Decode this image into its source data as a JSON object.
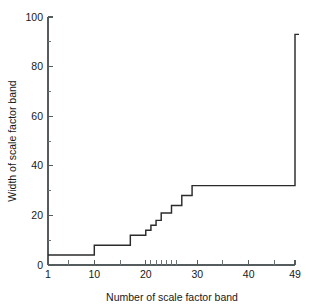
{
  "chart_data": {
    "type": "line",
    "line_style": "step-post",
    "title": "",
    "subtitle": "",
    "xlabel": "Number of scale factor band",
    "ylabel": "Width of scale factor band",
    "xlim": [
      1,
      49
    ],
    "ylim": [
      0,
      100
    ],
    "grid": false,
    "legend": null,
    "x_ticks_major": [
      1,
      10,
      20,
      30,
      40,
      49
    ],
    "x_tick_labels": [
      "1",
      "10",
      "20",
      "30",
      "40",
      "49"
    ],
    "x_ticks_minor": [
      5,
      15,
      21,
      22,
      23,
      24,
      25,
      26,
      35,
      45
    ],
    "y_ticks_major": [
      0,
      20,
      40,
      60,
      80,
      100
    ],
    "y_tick_labels": [
      "0",
      "20",
      "40",
      "60",
      "80",
      "100"
    ],
    "y_ticks_minor": [
      10,
      30,
      50,
      70,
      90
    ],
    "x": [
      1,
      2,
      3,
      4,
      5,
      6,
      7,
      8,
      9,
      10,
      11,
      12,
      13,
      14,
      15,
      16,
      17,
      18,
      19,
      20,
      21,
      22,
      23,
      24,
      25,
      26,
      27,
      28,
      29,
      30,
      31,
      32,
      33,
      34,
      35,
      36,
      37,
      38,
      39,
      40,
      41,
      42,
      43,
      44,
      45,
      46,
      47,
      48,
      49
    ],
    "values": [
      4,
      4,
      4,
      4,
      4,
      4,
      4,
      4,
      4,
      8,
      8,
      8,
      8,
      8,
      8,
      8,
      12,
      12,
      12,
      14,
      16,
      18,
      21,
      21,
      24,
      24,
      28,
      28,
      32,
      32,
      32,
      32,
      32,
      32,
      32,
      32,
      32,
      32,
      32,
      32,
      32,
      32,
      32,
      32,
      32,
      32,
      32,
      32,
      93
    ],
    "series": [
      {
        "name": "Width of scale factor band",
        "color": "#2b2b2b",
        "values": [
          4,
          4,
          4,
          4,
          4,
          4,
          4,
          4,
          4,
          8,
          8,
          8,
          8,
          8,
          8,
          8,
          12,
          12,
          12,
          14,
          16,
          18,
          21,
          21,
          24,
          24,
          28,
          28,
          32,
          32,
          32,
          32,
          32,
          32,
          32,
          32,
          32,
          32,
          32,
          32,
          32,
          32,
          32,
          32,
          32,
          32,
          32,
          32,
          93
        ]
      }
    ],
    "annotations": []
  },
  "style": {
    "line_color": "#2b2b2b",
    "axis_color": "#555c5e",
    "text_color": "#17191a",
    "background": "#ffffff"
  }
}
